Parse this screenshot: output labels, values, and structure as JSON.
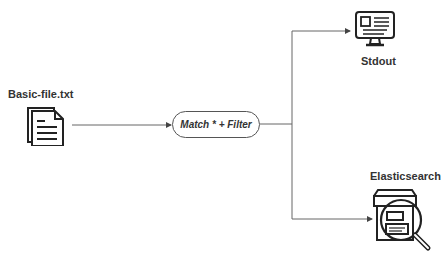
{
  "nodes": {
    "source": {
      "label": "Basic-file.txt",
      "icon": "documents-icon"
    },
    "processor": {
      "label": "Match * + Filter"
    },
    "output_stdout": {
      "label": "Stdout",
      "icon": "monitor-icon"
    },
    "output_elasticsearch": {
      "label": "Elasticsearch",
      "icon": "box-magnifier-icon"
    }
  },
  "edges": [
    {
      "from": "source",
      "to": "processor"
    },
    {
      "from": "processor",
      "to": "output_stdout"
    },
    {
      "from": "processor",
      "to": "output_elasticsearch"
    }
  ],
  "colors": {
    "line": "#666666",
    "stroke": "#222222",
    "text": "#333333"
  }
}
